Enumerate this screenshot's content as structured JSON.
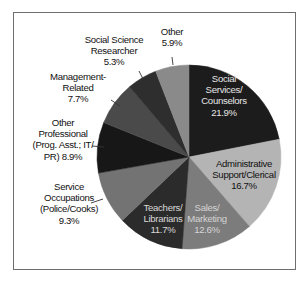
{
  "chart_data": {
    "type": "pie",
    "title": "",
    "start_angle_deg": 0,
    "direction": "clockwise",
    "center": [
      189,
      157
    ],
    "radius": 92,
    "slices": [
      {
        "label": "Social Services/ Counselors",
        "lines": [
          "Social",
          "Services/",
          "Counselors",
          "21.9%"
        ],
        "value": 21.9,
        "color": "#1c1c1c",
        "text_color": "#e6e6e6",
        "label_pos": [
          224,
          82
        ],
        "inside": true
      },
      {
        "label": "Administrative Support/Clerical",
        "lines": [
          "Administrative",
          "Support/Clerical",
          "16.7%"
        ],
        "value": 16.7,
        "color": "#b4b4b4",
        "text_color": "#111111",
        "label_pos": [
          244,
          167
        ],
        "inside": true
      },
      {
        "label": "Sales/ Marketing",
        "lines": [
          "Sales/",
          "Marketing",
          "12.6%"
        ],
        "value": 12.6,
        "color": "#7c7c7c",
        "text_color": "#d4d4d4",
        "label_pos": [
          207,
          211
        ],
        "inside": true
      },
      {
        "label": "Teachers/ Librarians",
        "lines": [
          "Teachers/",
          "Librarians",
          "11.7%"
        ],
        "value": 11.7,
        "color": "#2b2b2b",
        "text_color": "#d8d8d8",
        "label_pos": [
          163,
          211
        ],
        "inside": true
      },
      {
        "label": "Service Occupations (Police/Cooks)",
        "lines": [
          "Service",
          "Occupations",
          "(Police/Cooks)",
          "9.3%"
        ],
        "value": 9.3,
        "color": "#737373",
        "text_color": "#111111",
        "label_pos": [
          69,
          190
        ],
        "inside": false,
        "leader": [
          [
            91,
            203
          ],
          [
            103,
            199
          ]
        ]
      },
      {
        "label": "Other Professional (Prog. Asst.; IT/ PR)",
        "lines": [
          "Other",
          "Professional",
          "(Prog. Asst.; IT/",
          "PR) 8.9%"
        ],
        "value": 8.9,
        "color": "#171717",
        "text_color": "#111111",
        "label_pos": [
          63,
          126
        ],
        "inside": false,
        "leader": [
          [
            92,
            146
          ],
          [
            104,
            147
          ]
        ]
      },
      {
        "label": "Management-Related",
        "lines": [
          "Management-",
          "Related",
          "7.7%"
        ],
        "value": 7.7,
        "color": "#4a4a4a",
        "text_color": "#111111",
        "label_pos": [
          78,
          80
        ],
        "inside": false,
        "leader": [
          [
            111,
            100
          ],
          [
            120,
            106
          ]
        ]
      },
      {
        "label": "Social Science Researcher",
        "lines": [
          "Social Science",
          "Researcher",
          "5.3%"
        ],
        "value": 5.3,
        "color": "#2e2e2e",
        "text_color": "#111111",
        "label_pos": [
          114,
          43
        ],
        "inside": false,
        "leader": [
          [
            139,
            71
          ],
          [
            143,
            79
          ]
        ]
      },
      {
        "label": "Other",
        "lines": [
          "Other",
          "5.9%"
        ],
        "value": 5.9,
        "color": "#8a8a8a",
        "text_color": "#111111",
        "label_pos": [
          172,
          35
        ],
        "inside": false,
        "leader": [
          [
            172,
            57
          ],
          [
            173,
            65
          ]
        ]
      }
    ],
    "legend": null,
    "frame": true
  }
}
